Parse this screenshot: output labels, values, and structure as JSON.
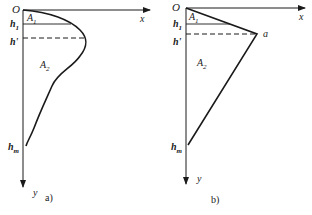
{
  "panels": [
    {
      "caption": "a)",
      "origin_label": "O",
      "x_label": "x",
      "y_label": "y",
      "h1_label": "h",
      "h1_sub": "1",
      "hprime_label": "h'",
      "hm_label": "h",
      "hm_sub": "m",
      "area1_label": "A",
      "area1_sub": "1",
      "area2_label": "A",
      "area2_sub": "2",
      "profile": "curve"
    },
    {
      "caption": "b)",
      "origin_label": "O",
      "x_label": "x",
      "y_label": "y",
      "h1_label": "h",
      "h1_sub": "1",
      "hprime_label": "h'",
      "hm_label": "h",
      "hm_sub": "m",
      "area1_label": "A",
      "area1_sub": "1",
      "area2_label": "A",
      "area2_sub": "2",
      "point_label": "a",
      "profile": "bilinear"
    }
  ],
  "colors": {
    "stroke": "#1a1a1a",
    "background": "#ffffff"
  }
}
